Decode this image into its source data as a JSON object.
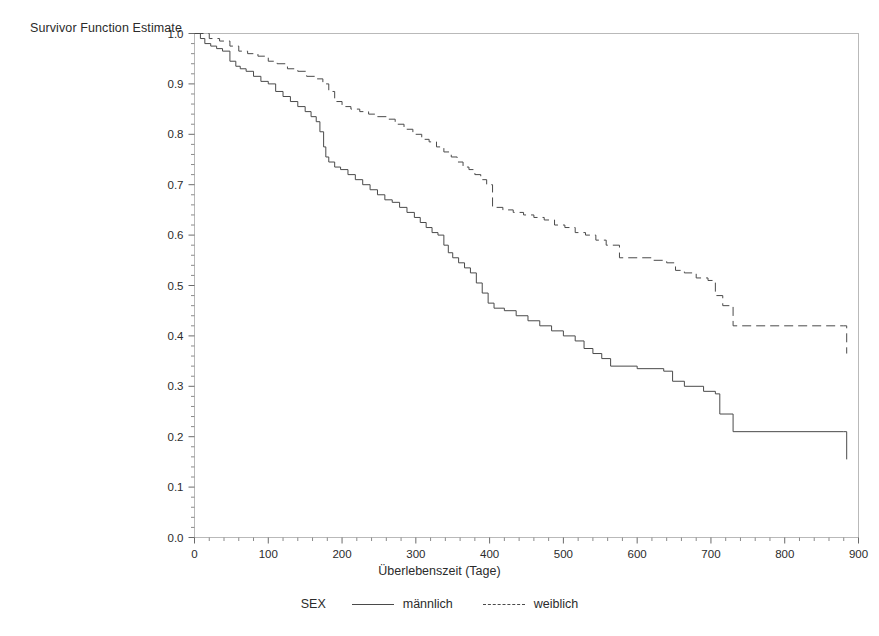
{
  "chart_data": {
    "type": "line",
    "title": "Survivor Function Estimate",
    "subtitle": "",
    "xlabel": "Überlebenszeit (Tage)",
    "ylabel": "",
    "xlim": [
      0,
      900
    ],
    "ylim": [
      0.0,
      1.0
    ],
    "xticks": [
      0,
      100,
      200,
      300,
      400,
      500,
      600,
      700,
      800,
      900
    ],
    "xtick_labels": [
      "0",
      "100",
      "200",
      "300",
      "400",
      "500",
      "600",
      "700",
      "800",
      "900"
    ],
    "yticks": [
      0.0,
      0.1,
      0.2,
      0.3,
      0.4,
      0.5,
      0.6,
      0.7,
      0.8,
      0.9,
      1.0
    ],
    "ytick_labels": [
      "0.0",
      "0.1",
      "0.2",
      "0.3",
      "0.4",
      "0.5",
      "0.6",
      "0.7",
      "0.8",
      "0.9",
      "1.0"
    ],
    "minor_ticks": true,
    "grid": false,
    "legend_title": "SEX",
    "legend_position": "bottom-center",
    "step_type": "post",
    "series": [
      {
        "name": "männlich",
        "label": "männlich",
        "style": "solid",
        "color": "#4a4a4a",
        "x": [
          0,
          8,
          14,
          22,
          30,
          38,
          48,
          56,
          62,
          70,
          80,
          90,
          100,
          110,
          120,
          130,
          140,
          150,
          158,
          165,
          170,
          175,
          178,
          182,
          190,
          198,
          208,
          218,
          228,
          238,
          248,
          258,
          268,
          278,
          288,
          298,
          306,
          314,
          322,
          330,
          338,
          344,
          350,
          358,
          366,
          374,
          382,
          390,
          398,
          406,
          420,
          436,
          452,
          468,
          484,
          500,
          516,
          528,
          540,
          552,
          564,
          600,
          636,
          648,
          664,
          690,
          706,
          712,
          730,
          880,
          884
        ],
        "y": [
          1.0,
          0.99,
          0.98,
          0.975,
          0.97,
          0.965,
          0.945,
          0.935,
          0.93,
          0.925,
          0.915,
          0.905,
          0.9,
          0.885,
          0.875,
          0.865,
          0.855,
          0.845,
          0.835,
          0.825,
          0.805,
          0.775,
          0.755,
          0.745,
          0.735,
          0.73,
          0.72,
          0.71,
          0.7,
          0.69,
          0.68,
          0.67,
          0.665,
          0.655,
          0.645,
          0.635,
          0.625,
          0.615,
          0.605,
          0.6,
          0.58,
          0.565,
          0.555,
          0.545,
          0.535,
          0.525,
          0.505,
          0.485,
          0.465,
          0.455,
          0.45,
          0.44,
          0.43,
          0.42,
          0.41,
          0.4,
          0.39,
          0.375,
          0.365,
          0.355,
          0.34,
          0.335,
          0.33,
          0.31,
          0.3,
          0.29,
          0.285,
          0.245,
          0.21,
          0.21,
          0.155
        ]
      },
      {
        "name": "weiblich",
        "label": "weiblich",
        "style": "dashed",
        "color": "#4a4a4a",
        "x": [
          0,
          20,
          34,
          48,
          60,
          72,
          86,
          100,
          112,
          126,
          140,
          152,
          164,
          174,
          182,
          190,
          200,
          212,
          224,
          236,
          248,
          260,
          272,
          284,
          296,
          308,
          318,
          328,
          338,
          348,
          356,
          364,
          372,
          380,
          388,
          396,
          404,
          418,
          432,
          446,
          460,
          474,
          488,
          502,
          516,
          530,
          544,
          558,
          576,
          600,
          620,
          640,
          652,
          664,
          680,
          696,
          706,
          716,
          730,
          880,
          884
        ],
        "y": [
          1.0,
          0.99,
          0.985,
          0.975,
          0.965,
          0.96,
          0.955,
          0.945,
          0.94,
          0.93,
          0.925,
          0.915,
          0.91,
          0.9,
          0.885,
          0.865,
          0.855,
          0.85,
          0.845,
          0.84,
          0.835,
          0.83,
          0.82,
          0.81,
          0.8,
          0.79,
          0.785,
          0.775,
          0.765,
          0.755,
          0.745,
          0.735,
          0.73,
          0.72,
          0.71,
          0.7,
          0.655,
          0.65,
          0.645,
          0.64,
          0.635,
          0.63,
          0.62,
          0.615,
          0.605,
          0.6,
          0.59,
          0.58,
          0.555,
          0.555,
          0.55,
          0.545,
          0.53,
          0.525,
          0.515,
          0.51,
          0.48,
          0.46,
          0.42,
          0.42,
          0.365
        ]
      }
    ]
  },
  "legend": {
    "title": "SEX",
    "entries": [
      {
        "label": "männlich",
        "style": "solid"
      },
      {
        "label": "weiblich",
        "style": "dashed"
      }
    ]
  }
}
